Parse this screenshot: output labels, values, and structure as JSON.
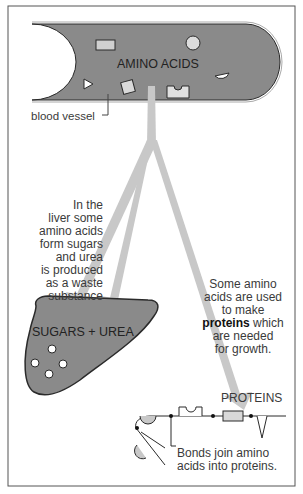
{
  "diagram": {
    "vessel_label": "AMINO ACIDS",
    "vessel_caption": "blood vessel",
    "liver_label": "SUGARS + UREA",
    "liver_text": "In the\nliver some\namino acids\nform sugars\nand urea\nis produced\nas a waste\nsubstance",
    "protein_text_pre": "Some amino\nacids are used\nto make",
    "protein_text_bold": "proteins",
    "protein_text_post": " which\nare needed\nfor growth.",
    "proteins_label": "PROTEINS",
    "bonds_text": "Bonds join amino\nacids into proteins.",
    "colors": {
      "fill": "#8a8a8a",
      "arrow": "#c8c8c8",
      "shape": "#d9d9d9",
      "outline": "#2a2a2a"
    }
  }
}
